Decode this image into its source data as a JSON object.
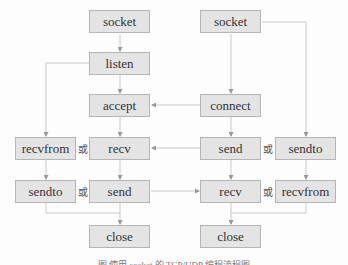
{
  "server": {
    "socket": "socket",
    "listen": "listen",
    "accept": "accept",
    "recv": "recv",
    "send": "send",
    "close": "close",
    "udp_recvfrom": "recvfrom",
    "udp_sendto": "sendto"
  },
  "client": {
    "socket": "socket",
    "connect": "connect",
    "send": "send",
    "recv": "recv",
    "close": "close",
    "udp_sendto": "sendto",
    "udp_recvfrom": "recvfrom"
  },
  "or_label": "或",
  "caption": "图   使用 socket 的 TCP/UDP 编程流程图",
  "colors": {
    "box_fill": "#e4e4e4",
    "box_border": "#b5b5b5",
    "line": "#c8c8c8",
    "text": "#333333"
  }
}
